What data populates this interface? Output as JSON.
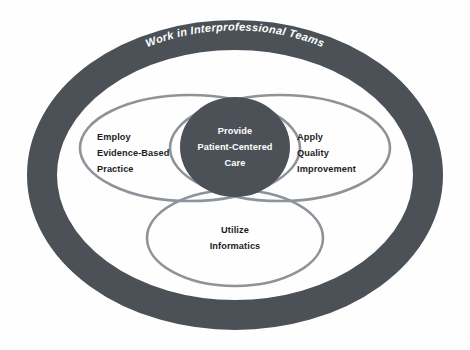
{
  "diagram": {
    "title": "Work in Interprofessional Teams",
    "type": "venn-nested-ellipses",
    "colors": {
      "ring_fill": "#4c5158",
      "core_fill": "#4c5158",
      "lobe_stroke": "#8e9399",
      "background": "#fefefe",
      "label_dark": "#1d1d1f",
      "label_light": "#ffffff"
    },
    "outer_ring": {
      "name": "Work in Interprofessional Teams",
      "label_lines": [
        "Work in Interprofessional Teams"
      ]
    },
    "core": {
      "name": "Provide Patient-Centered Care",
      "label_lines": [
        "Provide",
        "Patient-Centered",
        "Care"
      ]
    },
    "lobes": [
      {
        "name": "Employ Evidence-Based Practice",
        "position": "left",
        "label_lines": [
          "Employ",
          "Evidence-Based",
          "Practice"
        ]
      },
      {
        "name": "Apply Quality Improvement",
        "position": "right",
        "label_lines": [
          "Apply",
          "Quality",
          "Improvement"
        ]
      },
      {
        "name": "Utilize Informatics",
        "position": "bottom",
        "label_lines": [
          "Utilize",
          "Informatics"
        ]
      }
    ]
  }
}
